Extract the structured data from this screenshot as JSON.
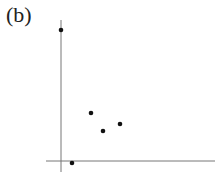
{
  "panel_label": "(b)",
  "chart_data": {
    "type": "scatter",
    "title": "",
    "xlabel": "",
    "ylabel": "",
    "grid": false,
    "legend": null,
    "axes": {
      "x_axis_pixel_y": 161,
      "y_axis_pixel_x": 61,
      "x_range_px": [
        46,
        215
      ],
      "y_range_px": [
        20,
        172
      ]
    },
    "points_px": [
      {
        "x": 61,
        "y": 30
      },
      {
        "x": 91,
        "y": 113
      },
      {
        "x": 103,
        "y": 131
      },
      {
        "x": 120,
        "y": 124
      },
      {
        "x": 72,
        "y": 163
      }
    ],
    "colors": {
      "axis": "#777777",
      "point": "#111111"
    }
  }
}
